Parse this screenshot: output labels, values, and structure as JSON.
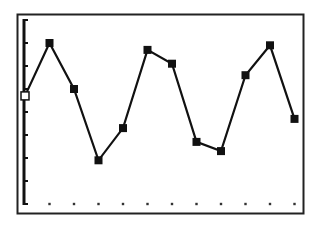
{
  "chart_data": {
    "type": "line",
    "title": "",
    "xlabel": "",
    "ylabel": "",
    "x": [
      0,
      1,
      2,
      3,
      4,
      5,
      6,
      7,
      8,
      9,
      10,
      11
    ],
    "values": [
      4.7,
      7.0,
      5.0,
      1.9,
      3.3,
      6.7,
      6.1,
      2.7,
      2.3,
      5.6,
      6.9,
      3.7
    ],
    "xlim": [
      0,
      11
    ],
    "ylim": [
      0,
      8
    ],
    "x_ticks": 12,
    "y_ticks": 9,
    "grid": false,
    "marker": "square",
    "legend": null
  },
  "style": {
    "line_color": "#111111",
    "frame_color": "#222222",
    "background": "#ffffff"
  }
}
